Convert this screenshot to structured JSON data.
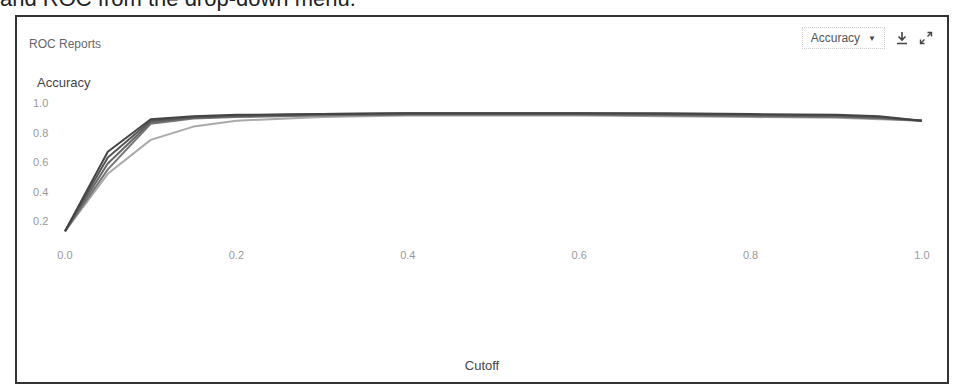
{
  "page": {
    "caption": "and ROC from the drop-down menu."
  },
  "panel": {
    "title": "ROC Reports",
    "dropdown": {
      "selected": "Accuracy"
    },
    "icons": [
      "download-icon",
      "expand-icon"
    ]
  },
  "chart_data": {
    "type": "line",
    "title": "ROC Reports",
    "xlabel": "Cutoff",
    "ylabel": "Accuracy",
    "xlim": [
      0.0,
      1.0
    ],
    "ylim": [
      0.1,
      1.0
    ],
    "xticks": [
      "0.0",
      "0.2",
      "0.4",
      "0.6",
      "0.8",
      "1.0"
    ],
    "yticks": [
      "0.2",
      "0.4",
      "0.6",
      "0.8",
      "1.0"
    ],
    "grid": false,
    "legend": "none",
    "x": [
      0.0,
      0.05,
      0.1,
      0.15,
      0.2,
      0.3,
      0.4,
      0.5,
      0.6,
      0.7,
      0.8,
      0.9,
      0.95,
      1.0
    ],
    "series": [
      {
        "name": "model-1",
        "color": "#444444",
        "values": [
          0.13,
          0.67,
          0.89,
          0.91,
          0.92,
          0.925,
          0.93,
          0.93,
          0.93,
          0.93,
          0.925,
          0.92,
          0.91,
          0.88
        ]
      },
      {
        "name": "model-2",
        "color": "#555555",
        "values": [
          0.13,
          0.63,
          0.88,
          0.905,
          0.915,
          0.925,
          0.93,
          0.93,
          0.93,
          0.925,
          0.92,
          0.915,
          0.905,
          0.88
        ]
      },
      {
        "name": "model-3",
        "color": "#666666",
        "values": [
          0.13,
          0.59,
          0.87,
          0.9,
          0.91,
          0.92,
          0.925,
          0.925,
          0.925,
          0.92,
          0.915,
          0.91,
          0.9,
          0.88
        ]
      },
      {
        "name": "model-4",
        "color": "#777777",
        "values": [
          0.13,
          0.55,
          0.86,
          0.895,
          0.905,
          0.915,
          0.92,
          0.92,
          0.92,
          0.915,
          0.91,
          0.905,
          0.895,
          0.88
        ]
      },
      {
        "name": "model-5",
        "color": "#aaaaaa",
        "values": [
          0.13,
          0.52,
          0.75,
          0.84,
          0.88,
          0.905,
          0.915,
          0.915,
          0.915,
          0.91,
          0.905,
          0.9,
          0.89,
          0.88
        ]
      }
    ]
  }
}
